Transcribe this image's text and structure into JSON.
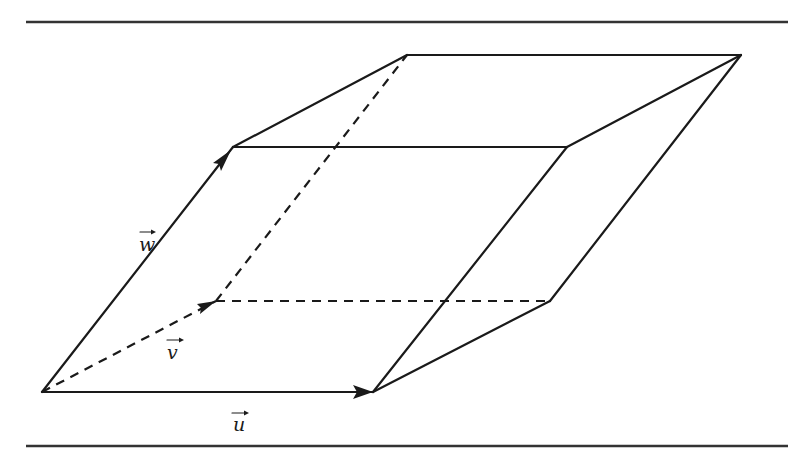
{
  "figure": {
    "colors": {
      "ink": "#1a1a1a",
      "rule": "#333333",
      "background": "#ffffff"
    },
    "labels": {
      "u": "u",
      "v": "v",
      "w": "w"
    },
    "vertices": {
      "origin": [
        42,
        392
      ],
      "u": [
        373,
        392
      ],
      "v": [
        216,
        301
      ],
      "w": [
        233,
        147
      ],
      "u_plus_v": [
        550,
        301
      ],
      "u_plus_w": [
        567,
        147
      ],
      "v_plus_w": [
        407,
        55
      ],
      "u_plus_v_plus_w": [
        741,
        55
      ]
    },
    "rules": {
      "top_y": 22,
      "bottom_y": 446
    }
  }
}
